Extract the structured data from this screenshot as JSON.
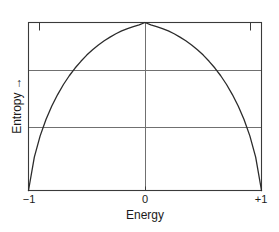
{
  "chart_data": {
    "type": "line",
    "title": "",
    "subtitle": "",
    "xlabel": "Energy",
    "ylabel": "Entropy →",
    "xlim": [
      -1,
      1
    ],
    "ylim": [
      0,
      1
    ],
    "xticks": [
      -1,
      0,
      1
    ],
    "xticklabels": [
      "−1",
      "0",
      "+1"
    ],
    "yticks": [],
    "yticklabels": [],
    "grid": "horizontal-and-center-vertical",
    "gridlines_y": [
      0.38,
      0.72
    ],
    "legend": "none",
    "annotations": [],
    "series": [
      {
        "name": "Entropy vs Energy",
        "color": "#2b2b2b",
        "x": [
          -1.0,
          -0.95,
          -0.9,
          -0.85,
          -0.8,
          -0.75,
          -0.7,
          -0.65,
          -0.6,
          -0.55,
          -0.5,
          -0.45,
          -0.4,
          -0.35,
          -0.3,
          -0.25,
          -0.2,
          -0.15,
          -0.1,
          -0.05,
          0.0,
          0.05,
          0.1,
          0.15,
          0.2,
          0.25,
          0.3,
          0.35,
          0.4,
          0.45,
          0.5,
          0.55,
          0.6,
          0.65,
          0.7,
          0.75,
          0.8,
          0.85,
          0.9,
          0.95,
          1.0
        ],
        "y": [
          0.0,
          0.199,
          0.325,
          0.423,
          0.503,
          0.571,
          0.631,
          0.683,
          0.729,
          0.769,
          0.806,
          0.838,
          0.866,
          0.891,
          0.913,
          0.933,
          0.95,
          0.964,
          0.976,
          0.986,
          1.0,
          0.986,
          0.976,
          0.964,
          0.95,
          0.933,
          0.913,
          0.891,
          0.866,
          0.838,
          0.806,
          0.769,
          0.729,
          0.683,
          0.631,
          0.571,
          0.503,
          0.423,
          0.325,
          0.199,
          0.0
        ]
      }
    ]
  },
  "axes": {
    "x_tick_labels": {
      "left": "−1",
      "center": "0",
      "right": "+1"
    },
    "x_title": "Energy",
    "y_title": "Entropy →"
  },
  "colors": {
    "curve": "#2b2b2b",
    "frame": "#3a3a3a",
    "grid": "#707070",
    "text": "#1a1a1a",
    "background": "#ffffff"
  }
}
